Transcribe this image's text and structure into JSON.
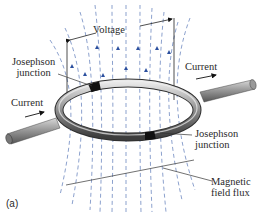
{
  "figure": {
    "panel_label": "(a)",
    "labels": {
      "voltage": "Voltage",
      "current_left": "Current",
      "current_right": "Current",
      "junction_top_line1": "Josephson",
      "junction_top_line2": "junction",
      "junction_bottom_line1": "Josephson",
      "junction_bottom_line2": "junction",
      "flux_line1": "Magnetic",
      "flux_line2": "field flux"
    },
    "colors": {
      "field_lines": "#5a78b8",
      "arrows": "#2b4f9e",
      "ring": "#8a8a8a",
      "junction": "#111111",
      "leader_lines": "#333333"
    }
  }
}
